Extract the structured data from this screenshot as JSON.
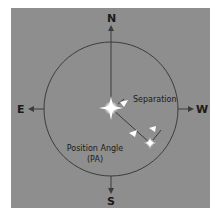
{
  "diagram": {
    "compass": {
      "north": "N",
      "south": "S",
      "east": "E",
      "west": "W"
    },
    "labels": {
      "separation": "Separation",
      "position_angle_line1": "Position Angle",
      "position_angle_line2": "(PA)"
    },
    "colors": {
      "background": "#8e8e8e",
      "lines": "#3a3a3a",
      "stars": "#ffffff",
      "text": "#1a1a1a"
    },
    "elements": {
      "primary_star": "bright-star",
      "secondary_star": "companion-star",
      "circle": "reference-circle"
    }
  }
}
